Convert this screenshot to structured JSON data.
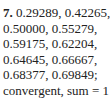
{
  "answer": {
    "number": "7.",
    "lines": [
      "0.29289, 0.42265,",
      "0.50000, 0.55279,",
      "0.59175, 0.62204,",
      "0.64645, 0.66667,",
      "0.68377, 0.69849;",
      "convergent, sum = 1"
    ]
  }
}
